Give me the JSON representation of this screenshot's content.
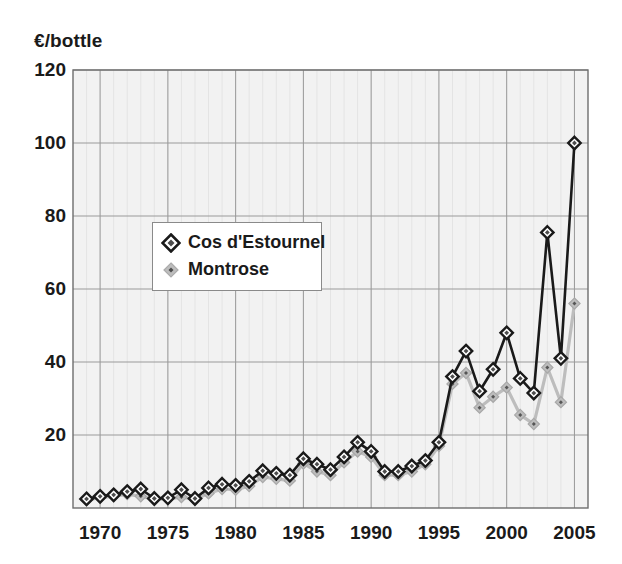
{
  "chart_data": {
    "type": "line",
    "title": "",
    "subtitle": "",
    "xlabel": "",
    "ylabel": "€/bottle",
    "ylim": [
      0,
      120
    ],
    "xlim": [
      1968,
      2006
    ],
    "y_ticks": [
      0,
      20,
      40,
      60,
      80,
      100,
      120
    ],
    "y_tick_labels": [
      "",
      "20",
      "40",
      "60",
      "80",
      "100",
      "120"
    ],
    "x_ticks": [
      1970,
      1975,
      1980,
      1985,
      1990,
      1995,
      2000,
      2005
    ],
    "x_tick_labels": [
      "1970",
      "1975",
      "1980",
      "1985",
      "1990",
      "1995",
      "2000",
      "2005"
    ],
    "grid": true,
    "grid_color": "#9a9a9a",
    "plot_bg": "#f2f2f2",
    "legend_position": "upper-left-inside",
    "x": [
      1969,
      1970,
      1971,
      1972,
      1973,
      1974,
      1975,
      1976,
      1977,
      1978,
      1979,
      1980,
      1981,
      1982,
      1983,
      1984,
      1985,
      1986,
      1987,
      1988,
      1989,
      1990,
      1991,
      1992,
      1993,
      1994,
      1995,
      1996,
      1997,
      1998,
      1999,
      2000,
      2001,
      2002,
      2003,
      2004,
      2005
    ],
    "series": [
      {
        "name": "Cos d'Estournel",
        "color": "#1a1a1a",
        "marker": "diamond-outline",
        "values": [
          2.5,
          3.2,
          3.6,
          4.5,
          5.2,
          2.6,
          2.8,
          5.0,
          2.6,
          5.5,
          6.5,
          6.2,
          7.3,
          10.2,
          9.5,
          9.0,
          13.5,
          12.0,
          10.5,
          14.0,
          18.0,
          15.5,
          10.0,
          10.0,
          11.5,
          13.0,
          18.0,
          36.0,
          43.0,
          32.0,
          38.0,
          48.0,
          35.5,
          31.5,
          75.5,
          41.0,
          100.0
        ]
      },
      {
        "name": "Montrose",
        "color": "#b3b3b3",
        "marker": "diamond-filled",
        "values": [
          2.2,
          2.8,
          3.2,
          3.8,
          3.2,
          2.4,
          2.5,
          3.0,
          2.3,
          4.0,
          5.2,
          5.0,
          6.0,
          8.5,
          8.0,
          7.5,
          12.2,
          10.0,
          9.0,
          12.5,
          15.5,
          14.0,
          9.0,
          9.0,
          10.0,
          12.0,
          17.0,
          34.0,
          37.0,
          27.5,
          30.5,
          33.0,
          25.5,
          23.0,
          38.5,
          29.0,
          56.0
        ]
      }
    ]
  },
  "legend": {
    "items": [
      {
        "label": "Cos d'Estournel",
        "marker": "diamond-outline-icon"
      },
      {
        "label": "Montrose",
        "marker": "diamond-filled-icon"
      }
    ]
  },
  "axes": {
    "y_title": "€/bottle"
  }
}
